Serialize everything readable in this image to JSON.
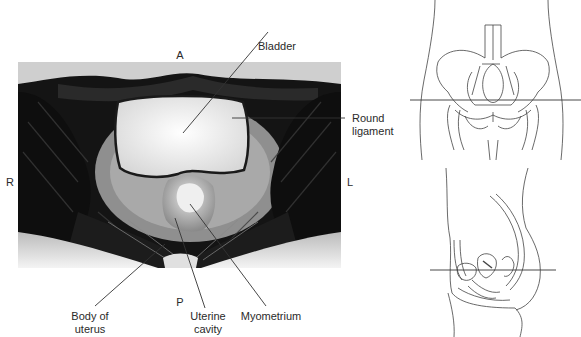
{
  "figure": {
    "orientation_labels": {
      "anterior": "A",
      "posterior": "P",
      "right": "R",
      "left": "L"
    },
    "annotations": [
      {
        "id": "bladder",
        "label": "Bladder"
      },
      {
        "id": "round-ligament",
        "label_line1": "Round",
        "label_line2": "ligament"
      },
      {
        "id": "body-of-uterus",
        "label_line1": "Body of",
        "label_line2": "uterus"
      },
      {
        "id": "uterine-cavity",
        "label_line1": "Uterine",
        "label_line2": "cavity"
      },
      {
        "id": "myometrium",
        "label": "Myometrium"
      }
    ],
    "panels": {
      "mri": "axial-mri-female-pelvis",
      "reference_frontal": "frontal-pelvis-line-drawing-with-slice-plane",
      "reference_sagittal": "sagittal-pelvis-line-drawing-with-slice-plane"
    },
    "colors": {
      "background": "#ffffff",
      "leader_line": "#333333",
      "bladder_fluid": "#f2f2f2",
      "muscle": "#1a1a1a",
      "fat": "#bdbdbd"
    }
  }
}
